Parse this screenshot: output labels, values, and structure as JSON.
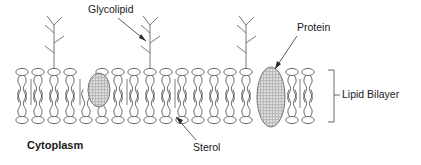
{
  "diagram": {
    "background_color": "#ffffff",
    "stroke_color": "#555555",
    "text_color": "#1a1a1a",
    "protein_fill": "#b0b0b0",
    "labels": {
      "glycolipid": "Glycolipid",
      "protein": "Protein",
      "lipid_bilayer": "Lipid Bilayer",
      "sterol": "Sterol",
      "cytoplasm": "Cytoplasm"
    },
    "structures": {
      "phospholipid_count_per_leaflet": 16,
      "glycolipid_count": 3,
      "sterol_count": 4,
      "protein_count": 2,
      "protein_sizes": [
        "small",
        "large"
      ]
    }
  }
}
